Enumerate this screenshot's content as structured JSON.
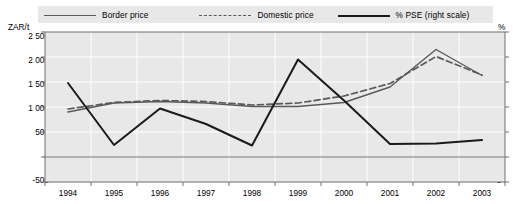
{
  "legend": {
    "items": [
      {
        "label": "Border price",
        "style": "solid-thin",
        "color": "#595959"
      },
      {
        "label": "Domestic price",
        "style": "dashed",
        "color": "#595959"
      },
      {
        "label": "% PSE (right scale)",
        "style": "solid-thick",
        "color": "#1a1a1a"
      }
    ]
  },
  "axes": {
    "left_unit": "ZAR/t",
    "right_unit": "%",
    "left_ticks": [
      "2 500",
      "2 000",
      "1 500",
      "1 000",
      "500",
      "0",
      "-500"
    ],
    "right_ticks": [
      "25",
      "20",
      "15",
      "10",
      "5",
      "0",
      "-5"
    ]
  },
  "chart_data": {
    "type": "line",
    "title": "",
    "xlabel": "",
    "ylabel": "ZAR/t",
    "y2label": "%",
    "grid": true,
    "legend_position": "top",
    "categories": [
      "1994",
      "1995",
      "1996",
      "1997",
      "1998",
      "1999",
      "2000",
      "2001",
      "2002",
      "2003"
    ],
    "ylim": [
      -500,
      2500
    ],
    "y2lim": [
      -5,
      25
    ],
    "yticks": [
      -500,
      0,
      500,
      1000,
      1500,
      2000,
      2500
    ],
    "y2ticks": [
      -5,
      0,
      5,
      10,
      15,
      20,
      25
    ],
    "series": [
      {
        "name": "Border price",
        "axis": "left",
        "style": "solid-thin",
        "color": "#595959",
        "values": [
          900,
          1080,
          1110,
          1080,
          1010,
          1010,
          1090,
          1400,
          2150,
          1630
        ]
      },
      {
        "name": "Domestic price",
        "axis": "left",
        "style": "dashed",
        "color": "#595959",
        "values": [
          960,
          1090,
          1130,
          1110,
          1040,
          1080,
          1220,
          1470,
          2010,
          1640
        ]
      },
      {
        "name": "% PSE (right scale)",
        "axis": "right",
        "style": "solid-thick",
        "color": "#1a1a1a",
        "values": [
          14.8,
          2.4,
          9.7,
          6.6,
          2.3,
          19.5,
          11.3,
          2.6,
          2.7,
          3.4
        ]
      }
    ]
  }
}
